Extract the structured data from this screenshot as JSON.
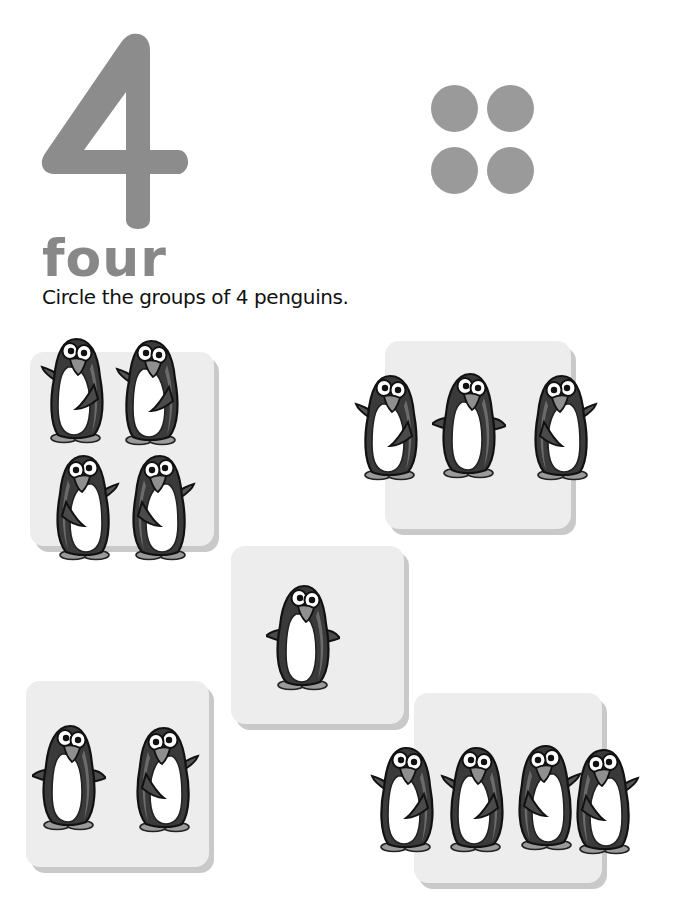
{
  "page": {
    "numeral": "4",
    "word": "four",
    "instruction": "Circle the groups of 4 penguins.",
    "dot_count": 4,
    "colors": {
      "numeral_gray": "#8c8c8c",
      "dot_gray": "#9a9a9a",
      "card_bg": "#ededed",
      "card_shadow": "#c9c9c9",
      "penguin_body": "#3a3a3a",
      "penguin_shade": "#6b6b6b",
      "penguin_beak": "#8f8f8f"
    }
  },
  "groups": [
    {
      "id": "group-top-left",
      "penguin_count": 4,
      "layout": "2x2"
    },
    {
      "id": "group-top-right",
      "penguin_count": 3,
      "layout": "row"
    },
    {
      "id": "group-middle",
      "penguin_count": 1,
      "layout": "single"
    },
    {
      "id": "group-bottom-left",
      "penguin_count": 2,
      "layout": "row"
    },
    {
      "id": "group-bottom-right",
      "penguin_count": 4,
      "layout": "row"
    }
  ]
}
